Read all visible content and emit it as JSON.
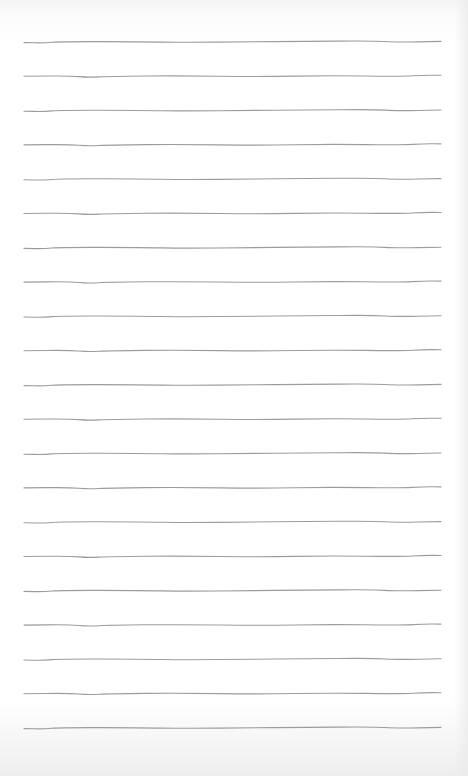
{
  "image": {
    "subject": "lined-paper-sheet",
    "description": "Blank sheet of ruled paper with hand-drawn horizontal lines",
    "line_count": 21,
    "line_color": "#9c9c9c",
    "paper_color": "#ffffff",
    "text": []
  }
}
